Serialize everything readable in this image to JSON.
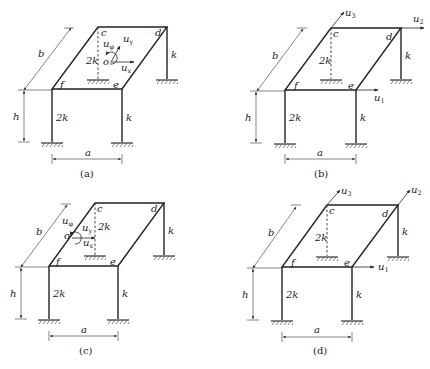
{
  "figure": {
    "type": "structural frame diagrams (single-story space frame with rigid slab)",
    "panels": [
      {
        "id": "a",
        "caption": "(a)",
        "nodes": [
          "c",
          "d",
          "e",
          "f",
          "o"
        ],
        "stiffness": {
          "f_col": "2k",
          "e_col": "k",
          "d_col": "k",
          "c_col": "2k"
        },
        "dimensions": {
          "a": "a",
          "b": "b",
          "h": "h"
        },
        "dofs": [
          {
            "label": "u",
            "sub": "φ",
            "kind": "rotation"
          },
          {
            "label": "u",
            "sub": "y",
            "kind": "translation"
          },
          {
            "label": "u",
            "sub": "x",
            "kind": "translation"
          }
        ],
        "origin_label": "o"
      },
      {
        "id": "b",
        "caption": "(b)",
        "nodes": [
          "c",
          "d",
          "e",
          "f"
        ],
        "stiffness": {
          "f_col": "2k",
          "e_col": "k",
          "d_col": "k",
          "c_col": "2k"
        },
        "dimensions": {
          "a": "a",
          "b": "b",
          "h": "h"
        },
        "dofs": [
          {
            "label": "u",
            "sub": "1"
          },
          {
            "label": "u",
            "sub": "2"
          },
          {
            "label": "u",
            "sub": "3"
          }
        ]
      },
      {
        "id": "c",
        "caption": "(c)",
        "nodes": [
          "c",
          "d",
          "e",
          "f",
          "o"
        ],
        "stiffness": {
          "f_col": "2k",
          "e_col": "k",
          "d_col": "k",
          "c_col": "2k"
        },
        "dimensions": {
          "a": "a",
          "b": "b",
          "h": "h"
        },
        "dofs": [
          {
            "label": "u",
            "sub": "φ",
            "kind": "rotation"
          },
          {
            "label": "u",
            "sub": "y",
            "kind": "translation"
          },
          {
            "label": "u",
            "sub": "x",
            "kind": "translation"
          }
        ],
        "origin_label": "o"
      },
      {
        "id": "d",
        "caption": "(d)",
        "nodes": [
          "c",
          "d",
          "e",
          "f"
        ],
        "stiffness": {
          "f_col": "2k",
          "e_col": "k",
          "d_col": "k",
          "c_col": "2k"
        },
        "dimensions": {
          "a": "a",
          "b": "b",
          "h": "h"
        },
        "dofs": [
          {
            "label": "u",
            "sub": "1"
          },
          {
            "label": "u",
            "sub": "2"
          },
          {
            "label": "u",
            "sub": "3"
          }
        ]
      }
    ]
  },
  "labels": {
    "a": "a",
    "b": "b",
    "h": "h",
    "k": "k",
    "two_k": "2k",
    "c": "c",
    "d": "d",
    "e": "e",
    "f": "f",
    "o": "o",
    "u": "u",
    "sub_phi": "φ",
    "sub_x": "x",
    "sub_y": "y",
    "sub_1": "1",
    "sub_2": "2",
    "sub_3": "3",
    "cap_a": "(a)",
    "cap_b": "(b)",
    "cap_c": "(c)",
    "cap_d": "(d)"
  },
  "colors": {
    "line": "#222222",
    "background": "#ffffff"
  }
}
